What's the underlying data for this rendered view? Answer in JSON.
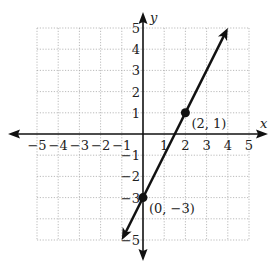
{
  "chart_data": {
    "type": "line",
    "title": "",
    "xlabel": "x",
    "ylabel": "y",
    "xlim": [
      -5,
      5
    ],
    "ylim": [
      -5,
      5
    ],
    "grid": true,
    "x_ticks": [
      -5,
      -4,
      -3,
      -2,
      -1,
      1,
      2,
      3,
      4,
      5
    ],
    "y_ticks": [
      -5,
      -3,
      -2,
      -1,
      1,
      2,
      3,
      4,
      5
    ],
    "x_tick_labels": [
      "−5",
      "−4",
      "−3",
      "−2",
      "−1",
      "1",
      "2",
      "3",
      "4",
      "5"
    ],
    "y_tick_labels": [
      "−5",
      "−3",
      "−2",
      "−1",
      "1",
      "2",
      "3",
      "4",
      "5"
    ],
    "series": [
      {
        "name": "line",
        "equation": "y = 2x - 3",
        "x": [
          -1,
          4
        ],
        "y": [
          -5,
          5
        ],
        "arrows_both_ends": true
      }
    ],
    "points": [
      {
        "x": 2,
        "y": 1,
        "label": "(2, 1)"
      },
      {
        "x": 0,
        "y": -3,
        "label": "(0, −3)"
      }
    ]
  },
  "colors": {
    "axis": "#111111",
    "grid": "#aaaaaa",
    "line": "#111111"
  }
}
